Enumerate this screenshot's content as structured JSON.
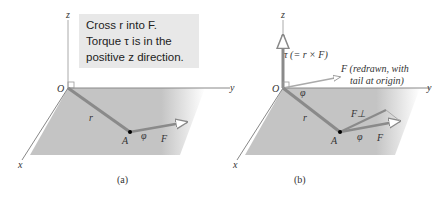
{
  "panel_a": {
    "caption": "(a)",
    "callout_lines": [
      "Cross r into F.",
      "Torque τ is in the",
      "positive z direction."
    ],
    "axis_labels": {
      "z": "z",
      "y": "y",
      "x": "x"
    },
    "origin_label": "O",
    "point_label": "A",
    "r_label": "r",
    "F_label": "F",
    "phi_label": "φ"
  },
  "panel_b": {
    "caption": "(b)",
    "tau_label": "τ (= r × F)",
    "F_redrawn_label_line1": "F (redrawn, with",
    "F_redrawn_label_line2": "tail at origin)",
    "axis_labels": {
      "z": "z",
      "y": "y",
      "x": "x"
    },
    "origin_label": "O",
    "point_label": "A",
    "r_label": "r",
    "F_label": "F",
    "F_perp_label": "F⊥",
    "phi_label": "φ"
  },
  "colors": {
    "plane": "#c4c4c4",
    "vector": "#8a8a8a",
    "axis": "#999999",
    "callout_bg": "#e8e8e8"
  }
}
